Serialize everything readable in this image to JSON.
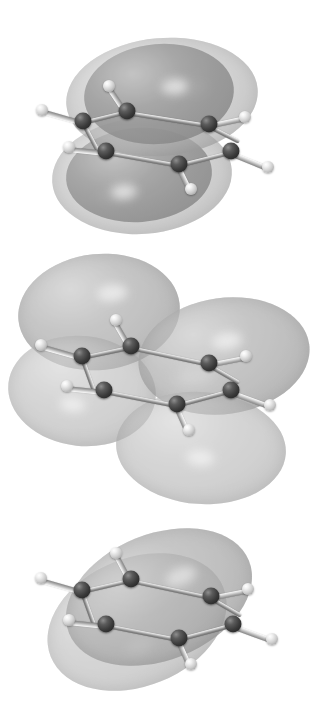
{
  "figure": {
    "rendering": "grayscale ball-and-stick model with translucent isosurface lobes",
    "background_color": "#ffffff",
    "atom_colors": {
      "carbon": "#3a3a3a",
      "hydrogen": "#e0e0e0",
      "bond": "#9a9a9a"
    },
    "lobe_colors": {
      "outer": "#b6b6b6",
      "mid": "#a9a9a9",
      "inner": "#8f8f8f",
      "highlight": "#e8e8e8"
    }
  },
  "panels": [
    {
      "id": "panel-1",
      "label": "Top panel",
      "orbital_name": "Antibonding pi* molecular orbital",
      "node_count": 2,
      "lobe_count": 4,
      "description": "Benzene ring viewed nearly edge-on with two large nested lobe shells above and below the ring plane",
      "molecule_atoms": {
        "carbon": 6,
        "hydrogen": 6
      }
    },
    {
      "id": "panel-2",
      "label": "Middle panel",
      "orbital_name": "Bonding pi molecular orbital with one nodal plane",
      "node_count": 1,
      "lobe_count": 4,
      "description": "Four large rounded lobes arranged upper-left, upper-right, lower-left and lower-right around the tilted benzene ring",
      "molecule_atoms": {
        "carbon": 6,
        "hydrogen": 6
      }
    },
    {
      "id": "panel-3",
      "label": "Bottom panel",
      "orbital_name": "Lowest-energy bonding pi molecular orbital",
      "node_count": 0,
      "lobe_count": 2,
      "description": "A single continuous doughnut-free pair of lobes covering the whole ring above and below the plane",
      "molecule_atoms": {
        "carbon": 6,
        "hydrogen": 6
      }
    }
  ],
  "ghost_text": {
    "note": "faint scanner bleed-through from the reverse page, illegible",
    "lines": [
      "",
      "",
      ""
    ]
  }
}
